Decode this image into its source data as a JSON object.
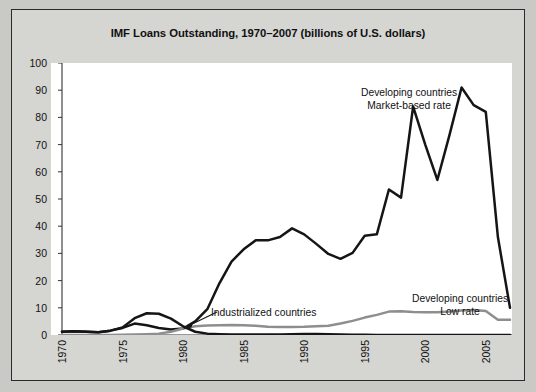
{
  "figure": {
    "title": "IMF Loans Outstanding, 1970–2007 (billions of U.S. dollars)",
    "border_color": "#2a2a2a",
    "background_color": "#d5d5d1",
    "plot_background_color": "#ffffff"
  },
  "annotations": {
    "market": {
      "line1": "Developing countries",
      "line2": "Market-based rate"
    },
    "low": {
      "line1": "Developing countries",
      "line2": "Low rate"
    },
    "industrial": {
      "label": "Industrialized countries"
    }
  },
  "chart_data": {
    "type": "line",
    "title": "IMF Loans Outstanding, 1970–2007 (billions of U.S. dollars)",
    "xlabel": "",
    "ylabel": "",
    "xlim": [
      1970,
      2007
    ],
    "ylim": [
      0,
      100
    ],
    "yticks": [
      0,
      10,
      20,
      30,
      40,
      50,
      60,
      70,
      80,
      90,
      100
    ],
    "xticks": [
      1970,
      1975,
      1980,
      1985,
      1990,
      1995,
      2000,
      2005
    ],
    "xticklabels": [
      "1970",
      "1975",
      "1980",
      "1985",
      "1990",
      "1995",
      "2000",
      "2005"
    ],
    "x_minor_tick_interval": 1,
    "grid": false,
    "legend": "annotations-inline",
    "x": [
      1970,
      1971,
      1972,
      1973,
      1974,
      1975,
      1976,
      1977,
      1978,
      1979,
      1980,
      1981,
      1982,
      1983,
      1984,
      1985,
      1986,
      1987,
      1988,
      1989,
      1990,
      1991,
      1992,
      1993,
      1994,
      1995,
      1996,
      1997,
      1998,
      1999,
      2000,
      2001,
      2002,
      2003,
      2004,
      2005,
      2006,
      2007
    ],
    "series": [
      {
        "name": "Developing countries Market-based rate",
        "color": "#151515",
        "values": [
          1.2,
          1.4,
          1.2,
          1.0,
          1.6,
          2.6,
          4.2,
          3.6,
          2.6,
          2.0,
          2.4,
          5.0,
          9.5,
          19.0,
          27.0,
          31.5,
          34.8,
          34.8,
          36.0,
          39.2,
          37.0,
          33.5,
          29.8,
          28.0,
          30.2,
          36.5,
          37.0,
          53.5,
          50.5,
          84.0,
          70.0,
          57.0,
          73.5,
          91.0,
          84.5,
          82.0,
          36.0,
          10.0
        ]
      },
      {
        "name": "Developing countries Low rate",
        "color": "#8e8e8e",
        "values": [
          0.0,
          0.0,
          0.0,
          0.0,
          0.0,
          0.1,
          0.2,
          0.3,
          0.5,
          1.2,
          2.4,
          3.2,
          3.5,
          3.6,
          3.7,
          3.6,
          3.4,
          3.0,
          2.9,
          2.9,
          3.0,
          3.2,
          3.4,
          4.2,
          5.2,
          6.4,
          7.4,
          8.6,
          8.7,
          8.5,
          8.4,
          8.4,
          8.6,
          9.0,
          9.2,
          8.8,
          5.6,
          5.6
        ]
      },
      {
        "name": "Industrialized countries",
        "color": "#151515",
        "values": [
          1.2,
          1.4,
          1.2,
          1.0,
          1.6,
          2.8,
          6.2,
          8.0,
          7.8,
          6.0,
          3.2,
          1.2,
          0.5,
          0.3,
          0.2,
          0.2,
          0.2,
          0.2,
          0.2,
          0.3,
          0.4,
          0.4,
          0.3,
          0.2,
          0.1,
          0.1,
          0.0,
          0.0,
          0.0,
          0.0,
          0.0,
          0.0,
          0.0,
          0.0,
          0.0,
          0.0,
          0.0,
          0.0
        ]
      }
    ]
  }
}
